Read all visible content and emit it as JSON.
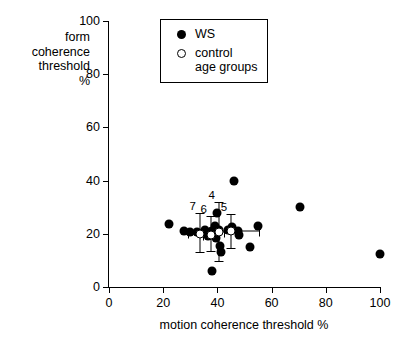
{
  "chart_data": {
    "type": "scatter",
    "title": "",
    "xlabel": "motion coherence threshold %",
    "ylabel": "form\ncoherence\nthreshold\n%",
    "ylabel_lines": [
      "form",
      "coherence",
      "threshold",
      "%"
    ],
    "xlim": [
      0,
      100
    ],
    "ylim": [
      0,
      100
    ],
    "xticks": [
      0,
      20,
      40,
      60,
      80,
      100
    ],
    "yticks": [
      0,
      20,
      40,
      60,
      80,
      100
    ],
    "xtick_labels": [
      "0",
      "20",
      "40",
      "60",
      "80",
      "100"
    ],
    "ytick_labels": [
      "0",
      "20",
      "40",
      "60",
      "80",
      "100"
    ],
    "grid": false,
    "legend_position": "top-right",
    "legend": [
      {
        "symbol": "filled-circle",
        "label": "WS"
      },
      {
        "symbol": "open-circle",
        "label": "control\nage groups"
      }
    ],
    "series": [
      {
        "name": "WS",
        "marker": "filled-circle",
        "color": "#000000",
        "points": [
          {
            "x": 22.0,
            "y": 23.5
          },
          {
            "x": 27.5,
            "y": 21.0
          },
          {
            "x": 30.0,
            "y": 20.5
          },
          {
            "x": 32.5,
            "y": 20.5
          },
          {
            "x": 35.5,
            "y": 21.5
          },
          {
            "x": 36.5,
            "y": 19.0
          },
          {
            "x": 38.0,
            "y": 21.0
          },
          {
            "x": 38.5,
            "y": 20.0
          },
          {
            "x": 39.0,
            "y": 23.0
          },
          {
            "x": 39.5,
            "y": 18.5
          },
          {
            "x": 40.0,
            "y": 28.0
          },
          {
            "x": 40.5,
            "y": 21.5
          },
          {
            "x": 41.0,
            "y": 15.5
          },
          {
            "x": 41.5,
            "y": 13.0
          },
          {
            "x": 38.0,
            "y": 6.0
          },
          {
            "x": 44.0,
            "y": 21.5
          },
          {
            "x": 45.5,
            "y": 22.5
          },
          {
            "x": 46.0,
            "y": 40.0
          },
          {
            "x": 47.5,
            "y": 21.0
          },
          {
            "x": 48.0,
            "y": 19.5
          },
          {
            "x": 52.0,
            "y": 15.0
          },
          {
            "x": 55.0,
            "y": 23.0
          },
          {
            "x": 70.5,
            "y": 30.0
          },
          {
            "x": 100.0,
            "y": 12.5
          }
        ]
      },
      {
        "name": "control age groups",
        "marker": "open-circle",
        "color": "#ffffff",
        "points": [
          {
            "x": 33.5,
            "y": 20.0,
            "label": "7",
            "xerr_low": 29.5,
            "xerr_high": 36.0,
            "yerr_low": 13.0,
            "yerr_high": 27.5
          },
          {
            "x": 37.5,
            "y": 19.5,
            "label": "6",
            "xerr_low": 35.0,
            "xerr_high": 40.0,
            "yerr_low": 13.5,
            "yerr_high": 26.5
          },
          {
            "x": 40.5,
            "y": 20.5,
            "label": "4",
            "xerr_low": 38.5,
            "xerr_high": 42.5,
            "yerr_low": 9.5,
            "yerr_high": 31.5
          },
          {
            "x": 45.0,
            "y": 21.0,
            "label": "5",
            "xerr_low": 37.0,
            "xerr_high": 55.5,
            "yerr_low": 14.5,
            "yerr_high": 27.0
          }
        ]
      }
    ],
    "point_labels": [
      "4",
      "5",
      "6",
      "7"
    ]
  }
}
